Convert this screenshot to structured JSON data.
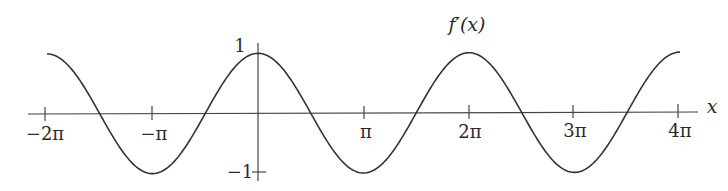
{
  "chart_data": {
    "type": "line",
    "xlabel": "x",
    "ylabel": "",
    "function": "cos(x)",
    "xlim": [
      "-2π",
      "4π"
    ],
    "ylim": [
      -1,
      1
    ],
    "grid": false,
    "legend": null,
    "x_ticks": [
      "-2π",
      "-π",
      "π",
      "2π",
      "3π",
      "4π"
    ],
    "y_ticks": [
      "1",
      "-1"
    ],
    "series": [
      {
        "name": "f'(x)",
        "x": [
          "-2π",
          "-3π/2",
          "-π",
          "-π/2",
          "0",
          "π/2",
          "π",
          "3π/2",
          "2π",
          "5π/2",
          "3π",
          "7π/2",
          "4π"
        ],
        "values": [
          1,
          0,
          -1,
          0,
          1,
          0,
          -1,
          0,
          1,
          0,
          -1,
          0,
          1
        ]
      }
    ]
  },
  "labels": {
    "curve_title": "f′(x)",
    "x_axis": "x",
    "y_top": "1",
    "y_bottom": "−1",
    "ticks": [
      "−2π",
      "−π",
      "π",
      "2π",
      "3π",
      "4π"
    ]
  },
  "colors": {
    "ink": "#2a2a2a",
    "background": "#ffffff"
  }
}
